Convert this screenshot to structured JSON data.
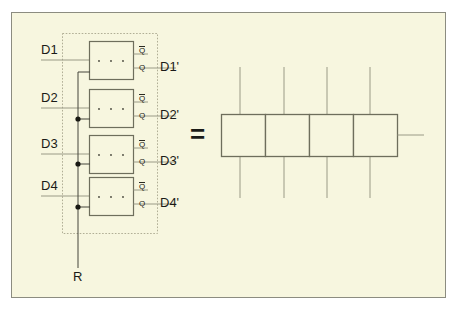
{
  "figure": {
    "kind": "logic-circuit-equivalence-diagram",
    "background_color": "#f7f6df",
    "frame_border_color": "#8c8c80",
    "wire_color": "#9a9a86",
    "box_border_color": "#6e6e5c",
    "text_color": "#1b1b17",
    "equals_sign": "=",
    "left_circuit": {
      "reset_label": "R",
      "dotted_boundary": true,
      "stages": [
        {
          "input_label": "D1",
          "output_label": "D1'",
          "q_bar_label": "Q",
          "q_label": "Q",
          "box_marks": "· · ·"
        },
        {
          "input_label": "D2",
          "output_label": "D2'",
          "q_bar_label": "Q",
          "q_label": "Q",
          "box_marks": "· · ·"
        },
        {
          "input_label": "D3",
          "output_label": "D3'",
          "q_bar_label": "Q",
          "q_label": "Q",
          "box_marks": "· · ·"
        },
        {
          "input_label": "D4",
          "output_label": "D4'",
          "q_bar_label": "Q",
          "q_label": "Q",
          "box_marks": "· · ·"
        }
      ],
      "junction_dots": 3
    },
    "right_circuit": {
      "cell_count": 4,
      "vertical_line_count": 4,
      "has_right_stub": true
    }
  }
}
